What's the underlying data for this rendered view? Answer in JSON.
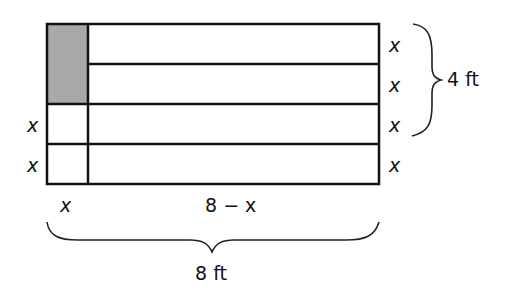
{
  "diagram": {
    "colors": {
      "shaded": "#a8a8a8",
      "stroke": "#111111",
      "background": "#ffffff"
    },
    "right_labels": [
      "x",
      "x",
      "x",
      "x"
    ],
    "left_labels": [
      "x",
      "x"
    ],
    "bottom_labels": {
      "left": "x",
      "right": "8 − x"
    },
    "height_brace_label": "4 ft",
    "width_brace_label": "8 ft"
  }
}
